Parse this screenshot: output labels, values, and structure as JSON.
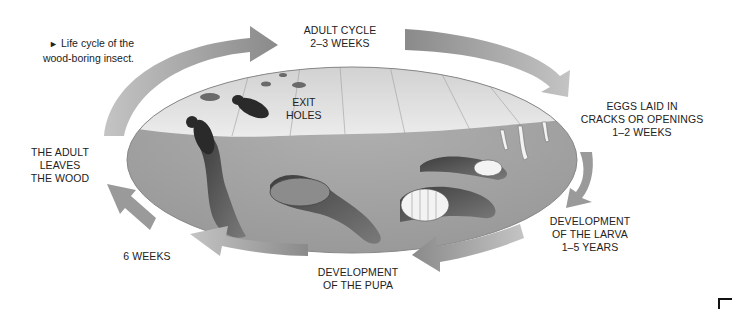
{
  "caption": {
    "marker": "►",
    "line1": "Life cycle of the",
    "line2": "wood-boring insect."
  },
  "stages": {
    "adult_cycle": {
      "line1": "ADULT CYCLE",
      "line2": "2–3 WEEKS"
    },
    "eggs": {
      "line1": "EGGS LAID IN",
      "line2": "CRACKS OR OPENINGS",
      "line3": "1–2 WEEKS"
    },
    "larva": {
      "line1": "DEVELOPMENT",
      "line2": "OF THE LARVA",
      "line3": "1–5 YEARS"
    },
    "pupa": {
      "line1": "DEVELOPMENT",
      "line2": "OF THE PUPA"
    },
    "six_weeks": {
      "line1": "6 WEEKS"
    },
    "adult_leaves": {
      "line1": "THE ADULT",
      "line2": "LEAVES",
      "line3": "THE WOOD"
    }
  },
  "illustration": {
    "exit_holes": {
      "line1": "EXIT",
      "line2": "HOLES"
    }
  },
  "colors": {
    "arrow": "#8f8f8f",
    "wood_surface": "#e4e4e4",
    "wood_interior": "#a5a5a5",
    "tunnel": "#5a5a5a",
    "text": "#222222"
  }
}
